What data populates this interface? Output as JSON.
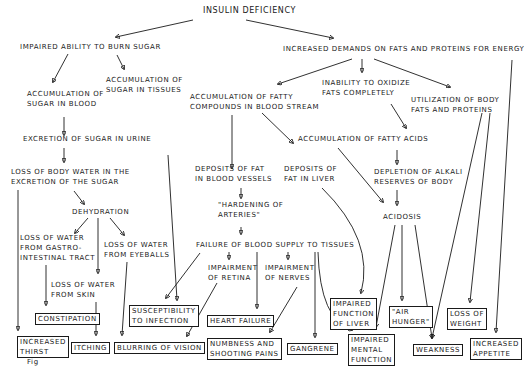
{
  "diagram": {
    "root": "INSULIN DEFICIENCY",
    "nodes": {
      "impaired_burn": "IMPAIRED ABILITY TO BURN SUGAR",
      "increased_demands": "INCREASED DEMANDS ON FATS AND PROTEINS FOR ENERGY",
      "sugar_blood": "ACCUMULATION OF\nSUGAR IN BLOOD",
      "sugar_tissues": "ACCUMULATION OF\nSUGAR IN TISSUES",
      "fatty_compounds": "ACCUMULATION OF FATTY\nCOMPOUNDS IN BLOOD STREAM",
      "inability_oxidize": "INABILITY TO OXIDIZE\nFATS COMPLETELY",
      "utilization": "UTILIZATION OF BODY\nFATS AND PROTEINS",
      "excretion_urine": "EXCRETION OF SUGAR IN URINE",
      "fatty_acids": "ACCUMULATION OF FATTY ACIDS",
      "loss_body_water": "LOSS OF BODY WATER IN THE\nEXCRETION OF THE SUGAR",
      "deposits_vessels": "DEPOSITS OF FAT\nIN BLOOD VESSELS",
      "deposits_liver": "DEPOSITS OF\nFAT IN LIVER",
      "depletion_alkali": "DEPLETION OF ALKALI\nRESERVES OF BODY",
      "hardening": "\"HARDENING OF\nARTERIES\"",
      "dehydration": "DEHYDRATION",
      "acidosis": "ACIDOSIS",
      "loss_gi": "LOSS OF WATER\nFROM GASTRO-\nINTESTINAL TRACT",
      "loss_eyeballs": "LOSS OF WATER\nFROM EYEBALLS",
      "loss_skin": "LOSS OF WATER\nFROM SKIN",
      "failure_blood_supply": "FAILURE OF BLOOD SUPPLY TO TISSUES",
      "impair_retina": "IMPAIRMENT\nOF RETINA",
      "impair_nerves": "IMPAIRMENT\nOF NERVES"
    },
    "outcomes": {
      "constipation": "CONSTIPATION",
      "susceptibility": "SUSCEPTIBILITY\nTO INFECTION",
      "heart_failure": "HEART FAILURE",
      "impaired_liver": "IMPAIRED\nFUNCTION\nOF LIVER",
      "air_hunger": "\"AIR\nHUNGER\"",
      "loss_weight": "LOSS OF\nWEIGHT",
      "increased_thirst": "INCREASED\nTHIRST",
      "itching": "ITCHING",
      "blurring": "BLURRING OF VISION",
      "numbness": "NUMBNESS AND\nSHOOTING PAINS",
      "gangrene": "GANGRENE",
      "impaired_mental": "IMPAIRED\nMENTAL\nFUNCTION",
      "weakness": "WEAKNESS",
      "increased_appetite": "INCREASED\nAPPETITE"
    },
    "caption": "Fig"
  }
}
